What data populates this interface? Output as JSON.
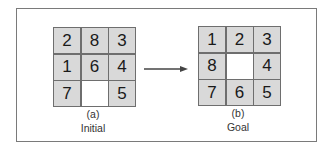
{
  "colors": {
    "tile": "#d9d9d9",
    "blank": "#ffffff",
    "line": "#6e6e6e",
    "frame": "#7a7a7a"
  },
  "initial": {
    "tag": "(a)",
    "caption": "Initial",
    "cells": [
      "2",
      "8",
      "3",
      "1",
      "6",
      "4",
      "7",
      "",
      "5"
    ]
  },
  "goal": {
    "tag": "(b)",
    "caption": "Goal",
    "cells": [
      "1",
      "2",
      "3",
      "8",
      "",
      "4",
      "7",
      "6",
      "5"
    ]
  },
  "arrow": {
    "icon": "right-arrow-icon"
  }
}
